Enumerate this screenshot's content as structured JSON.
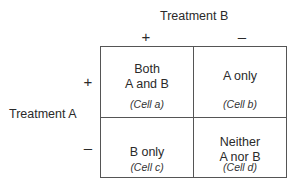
{
  "diagram": {
    "column_header": "Treatment B",
    "column_signs": [
      "+",
      "–"
    ],
    "row_header": "Treatment A",
    "row_signs": [
      "+",
      "–"
    ],
    "cells": [
      {
        "line1": "Both",
        "line2": "A and B",
        "label": "(Cell a)"
      },
      {
        "line1": "A only",
        "line2": "",
        "label": "(Cell b)"
      },
      {
        "line1": "B only",
        "line2": "",
        "label": "(Cell c)"
      },
      {
        "line1": "Neither",
        "line2": "A nor B",
        "label": "(Cell d)"
      }
    ],
    "line_color": "#555555"
  }
}
